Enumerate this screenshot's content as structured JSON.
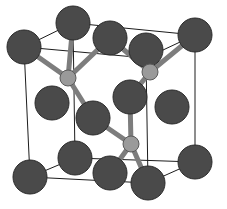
{
  "figure": {
    "background_color": "#ffffff",
    "width": 227,
    "height": 209
  },
  "legend": {
    "anion_label": "large dark sphere (lattice site atom)",
    "cation_label": "small light sphere (tetrahedral interstitial atom)"
  },
  "style": {
    "anion_fill": "#4a4a4a",
    "anion_stroke": "#2b2b2b",
    "cation_fill": "#9a9a9a",
    "cation_stroke": "#5a5a5a",
    "bond_color": "#7d7d7d",
    "bond_stroke": "#4f4f4f",
    "cell_edge_color": "#1c1c1c",
    "cell_edge_width": 1,
    "bond_width": 5,
    "anion_radius": 17,
    "cation_radius": 8
  },
  "chart_data": {
    "type": "scatter",
    "xlabel": "",
    "ylabel": "",
    "grid": false,
    "legend_position": "none",
    "xlim": [
      0,
      227
    ],
    "ylim": [
      0,
      209
    ],
    "series": [
      {
        "name": "anion",
        "role": "large-dark-atom",
        "color": "#4a4a4a",
        "radius": 17,
        "points": [
          {
            "id": "A1",
            "x": 24,
            "y": 47,
            "label": "front-top-left corner"
          },
          {
            "id": "A2",
            "x": 73,
            "y": 23,
            "label": "back-top-left corner"
          },
          {
            "id": "A3",
            "x": 110,
            "y": 38,
            "label": "top-face atom"
          },
          {
            "id": "A4",
            "x": 146,
            "y": 50,
            "label": "front-top-right area"
          },
          {
            "id": "A5",
            "x": 195,
            "y": 35,
            "label": "back-top-right corner"
          },
          {
            "id": "A6",
            "x": 52,
            "y": 103,
            "label": "left-face atom"
          },
          {
            "id": "A7",
            "x": 93,
            "y": 118,
            "label": "interior-front atom"
          },
          {
            "id": "A8",
            "x": 130,
            "y": 97,
            "label": "interior-back atom"
          },
          {
            "id": "A9",
            "x": 172,
            "y": 107,
            "label": "right-face atom"
          },
          {
            "id": "A10",
            "x": 75,
            "y": 158,
            "label": "bottom-face atom"
          },
          {
            "id": "A11",
            "x": 110,
            "y": 173,
            "label": "front-bottom atom"
          },
          {
            "id": "A12",
            "x": 148,
            "y": 183,
            "label": "front-bottom-right corner"
          },
          {
            "id": "A13",
            "x": 30,
            "y": 177,
            "label": "front-bottom-left corner"
          },
          {
            "id": "A14",
            "x": 195,
            "y": 162,
            "label": "back-bottom-right corner"
          }
        ]
      },
      {
        "name": "cation",
        "role": "small-light-atom",
        "color": "#9a9a9a",
        "radius": 8,
        "points": [
          {
            "id": "C1",
            "x": 68,
            "y": 78,
            "label": "upper-left tetrahedral site"
          },
          {
            "id": "C2",
            "x": 150,
            "y": 72,
            "label": "upper-right tetrahedral site"
          },
          {
            "id": "C3",
            "x": 131,
            "y": 144,
            "label": "lower-center tetrahedral site"
          }
        ]
      }
    ],
    "bonds": [
      {
        "from": "C1",
        "to": "A1"
      },
      {
        "from": "C1",
        "to": "A2"
      },
      {
        "from": "C1",
        "to": "A3"
      },
      {
        "from": "C1",
        "to": "A7"
      },
      {
        "from": "C2",
        "to": "A3"
      },
      {
        "from": "C2",
        "to": "A4"
      },
      {
        "from": "C2",
        "to": "A5"
      },
      {
        "from": "C2",
        "to": "A8"
      },
      {
        "from": "C3",
        "to": "A7"
      },
      {
        "from": "C3",
        "to": "A8"
      },
      {
        "from": "C3",
        "to": "A11"
      },
      {
        "from": "C3",
        "to": "A12"
      }
    ],
    "cell_edges": [
      {
        "from": [
          24,
          47
        ],
        "to": [
          73,
          23
        ]
      },
      {
        "from": [
          73,
          23
        ],
        "to": [
          195,
          35
        ]
      },
      {
        "from": [
          195,
          35
        ],
        "to": [
          146,
          58
        ]
      },
      {
        "from": [
          146,
          58
        ],
        "to": [
          24,
          47
        ]
      },
      {
        "from": [
          24,
          47
        ],
        "to": [
          30,
          177
        ]
      },
      {
        "from": [
          73,
          23
        ],
        "to": [
          75,
          158
        ]
      },
      {
        "from": [
          195,
          35
        ],
        "to": [
          195,
          162
        ]
      },
      {
        "from": [
          146,
          58
        ],
        "to": [
          148,
          183
        ]
      },
      {
        "from": [
          30,
          177
        ],
        "to": [
          75,
          158
        ]
      },
      {
        "from": [
          75,
          158
        ],
        "to": [
          195,
          162
        ]
      },
      {
        "from": [
          195,
          162
        ],
        "to": [
          148,
          183
        ]
      },
      {
        "from": [
          148,
          183
        ],
        "to": [
          30,
          177
        ]
      }
    ]
  }
}
